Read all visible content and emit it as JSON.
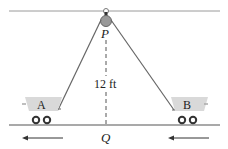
{
  "diagram": {
    "pulley_label": "P",
    "ground_point_label": "Q",
    "height_label": "12 ft",
    "cart_left_label": "A",
    "cart_right_label": "B",
    "colors": {
      "line": "#7a7a7a",
      "cart": "#d9d9d9",
      "wheel": "#333333",
      "text": "#222222"
    }
  }
}
